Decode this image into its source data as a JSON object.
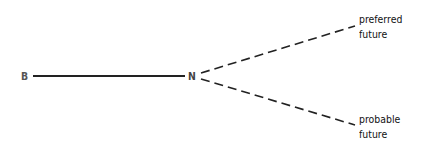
{
  "diagram": {
    "nodes": {
      "start": {
        "label": "B",
        "x": 22,
        "y": 76
      },
      "now": {
        "label": "N",
        "x": 189,
        "y": 76
      }
    },
    "edges": [
      {
        "from": "B",
        "to": "N",
        "style": "solid"
      },
      {
        "from": "N",
        "to": "preferred future",
        "style": "dashed"
      },
      {
        "from": "N",
        "to": "probable future",
        "style": "dashed"
      }
    ],
    "labels": {
      "preferred": {
        "line1": "preferred",
        "line2": "future"
      },
      "probable": {
        "line1": "probable",
        "line2": "future"
      }
    },
    "colors": {
      "line": "#222222",
      "node_text": "#555555",
      "label_text": "#111111"
    }
  }
}
